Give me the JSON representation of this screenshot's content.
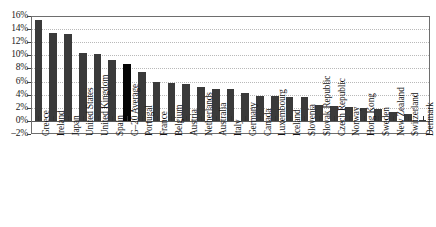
{
  "chart_data": {
    "type": "bar",
    "title": "",
    "subtitle": "",
    "xlabel": "",
    "ylabel": "",
    "ylim": [
      -2,
      16
    ],
    "ytick_labels": [
      "16%",
      "14%",
      "12%",
      "10%",
      "8%",
      "6%",
      "4%",
      "2%",
      "0%",
      "–2%"
    ],
    "ytick_values": [
      16,
      14,
      12,
      10,
      8,
      6,
      4,
      2,
      0,
      -2
    ],
    "ytick_step": 2,
    "grid": true,
    "grid_style": "dotted-horizontal",
    "legend": "none",
    "categories": [
      "Greece",
      "Ireland",
      "Japan",
      "United States",
      "United Kingdom",
      "Spain",
      "G–20 Average",
      "Portugal",
      "France",
      "Belgium",
      "Austria",
      "Netherlands",
      "Australia",
      "Italy",
      "Germany",
      "Canada",
      "Luxembourg",
      "Iceland",
      "Slovenia",
      "Slovak Republic",
      "Czech Republic",
      "Norway",
      "Hong Kong",
      "Sweden",
      "New Zealand",
      "Switzerland",
      "Denmark"
    ],
    "values": [
      15.4,
      13.4,
      13.2,
      10.4,
      10.2,
      9.3,
      8.7,
      7.4,
      6.0,
      5.8,
      5.6,
      5.2,
      4.8,
      4.8,
      4.3,
      3.8,
      3.8,
      3.6,
      3.6,
      2.5,
      2.3,
      2.1,
      1.9,
      1.8,
      1.4,
      1.0,
      0.2
    ],
    "highlight_category": "G–20 Average",
    "highlight_index": 6,
    "bar_color": "#3a3a3a",
    "highlight_color": "#050505",
    "grid_color": "#b9b9b9",
    "axis_color": "#6e6e6e",
    "background_color": "#ffffff"
  }
}
